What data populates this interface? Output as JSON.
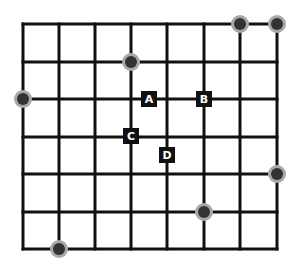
{
  "grid": {
    "x_lines": [
      23,
      59,
      95,
      131,
      167,
      204,
      240,
      277
    ],
    "y_lines": [
      24,
      62,
      99,
      137,
      174,
      212,
      249
    ],
    "line_color": "#111111",
    "columns": 7,
    "rows": 6
  },
  "labels": [
    {
      "text": "A",
      "x": 149,
      "y": 99
    },
    {
      "text": "B",
      "x": 204,
      "y": 99
    },
    {
      "text": "C",
      "x": 131,
      "y": 136
    },
    {
      "text": "D",
      "x": 167,
      "y": 155
    }
  ],
  "dots": [
    {
      "x": 131,
      "y": 62
    },
    {
      "x": 240,
      "y": 24
    },
    {
      "x": 277,
      "y": 24
    },
    {
      "x": 23,
      "y": 99
    },
    {
      "x": 277,
      "y": 174
    },
    {
      "x": 204,
      "y": 212
    },
    {
      "x": 59,
      "y": 249
    }
  ],
  "dot_fill": "#333333",
  "dot_ring": "#a8a8a8",
  "label_bg": "#111111",
  "label_fg": "#ffffff"
}
